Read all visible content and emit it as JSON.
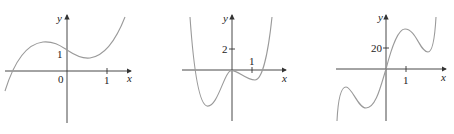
{
  "graphs": [
    {
      "id": "graph-a",
      "y_label": "y",
      "x_label": "x",
      "origin_label": "0",
      "y_tick_label": "1",
      "x_tick_label": "1",
      "curve": "cubic with local max left of y-axis and local min right of y-axis, y-intercept 1"
    },
    {
      "id": "graph-b",
      "y_label": "y",
      "x_label": "x",
      "y_tick_label": "2",
      "x_tick_label": "1",
      "curve": "quartic W-shape with deep min left, local max near origin, shallow min right"
    },
    {
      "id": "graph-c",
      "y_label": "y",
      "x_label": "x",
      "y_tick_label": "20",
      "x_tick_label": "1",
      "curve": "quintic passing through origin with local max/min on each side"
    }
  ],
  "colors": {
    "axis": "#333333",
    "curve": "#9a9a9a"
  }
}
